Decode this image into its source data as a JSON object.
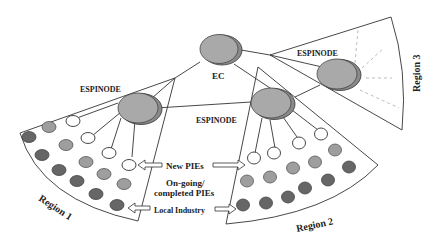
{
  "diagram": {
    "nodes": {
      "ec": {
        "label": "EC"
      },
      "espinode_1": {
        "label": "ESPINODE"
      },
      "espinode_2": {
        "label": "ESPINODE"
      },
      "espinode_3": {
        "label": "ESPINODE"
      }
    },
    "regions": [
      {
        "id": "region-1",
        "label": "Region 1"
      },
      {
        "id": "region-2",
        "label": "Region 2"
      },
      {
        "id": "region-3",
        "label": "Region 3"
      }
    ],
    "legend": {
      "new_pies": "New PIEs",
      "ongoing_line1": "On-going/",
      "ongoing_line2": "completed  PIEs",
      "local_industry": "Local Industry"
    },
    "colors": {
      "node_fill": "#a9a9a9",
      "new_pie_fill": "#ffffff",
      "ongoing_pie_fill": "#9e9e9e",
      "local_industry_fill": "#666666"
    }
  }
}
